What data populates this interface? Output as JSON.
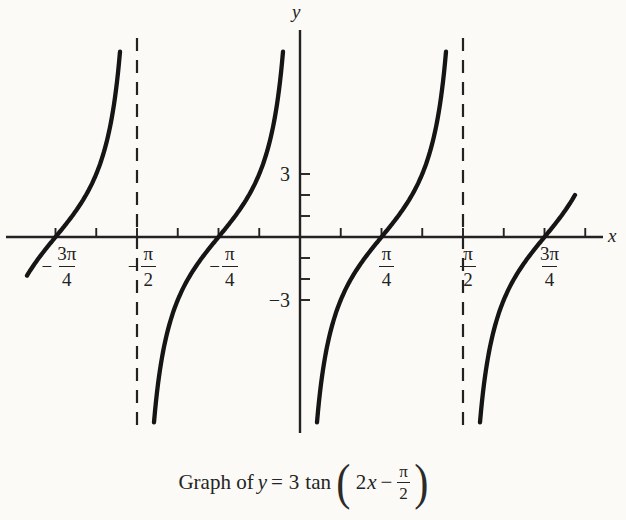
{
  "figure": {
    "caption": {
      "prefix": "Graph of",
      "y_var": "y",
      "equals": "=",
      "coefficient": "3",
      "func": "tan",
      "lparen": "(",
      "rparen": ")",
      "arg_coeff": "2",
      "arg_var": "x",
      "minus": "−",
      "frac_num": "π",
      "frac_den": "2"
    }
  },
  "chart_data": {
    "type": "line",
    "function": "y = 3 tan(2x − π/2)",
    "amplitude": 3,
    "angular_frequency": 2,
    "phase_shift": "π/2",
    "phase_shift_rad": 1.5707963,
    "period": "π/2",
    "x_axis": {
      "label": "x",
      "units": "radians",
      "minor_tick_step": "π/8",
      "tick_values_over_pi": [
        -0.75,
        -0.625,
        -0.5,
        -0.375,
        -0.25,
        -0.125,
        0.125,
        0.25,
        0.375,
        0.5,
        0.625,
        0.75,
        0.875
      ],
      "labeled_ticks": [
        {
          "value_over_pi": -0.75,
          "sign": "−",
          "num": "3π",
          "den": "4"
        },
        {
          "value_over_pi": -0.5,
          "sign": "−",
          "num": "π",
          "den": "2"
        },
        {
          "value_over_pi": -0.25,
          "sign": "−",
          "num": "π",
          "den": "4"
        },
        {
          "value_over_pi": 0.25,
          "sign": "",
          "num": "π",
          "den": "4"
        },
        {
          "value_over_pi": 0.5,
          "sign": "",
          "num": "π",
          "den": "2"
        },
        {
          "value_over_pi": 0.75,
          "sign": "",
          "num": "3π",
          "den": "4"
        }
      ]
    },
    "y_axis": {
      "label": "y",
      "tick_values": [
        3,
        2,
        1,
        -1,
        -2,
        -3
      ],
      "labeled_ticks": [
        {
          "value": 3,
          "label": "3"
        },
        {
          "value": -3,
          "label": "−3"
        }
      ]
    },
    "asymptotes": {
      "style": "dashed",
      "values_over_pi": [
        -0.5,
        0.5
      ]
    },
    "zeros_over_pi": [
      -0.75,
      -0.25,
      0.25,
      0.75
    ],
    "branches_over_pi": [
      [
        -0.85,
        -0.5
      ],
      [
        -0.5,
        0
      ],
      [
        0,
        0.5
      ],
      [
        0.5,
        0.88
      ]
    ],
    "curve_color": "#151515",
    "ink_color": "#222222"
  }
}
